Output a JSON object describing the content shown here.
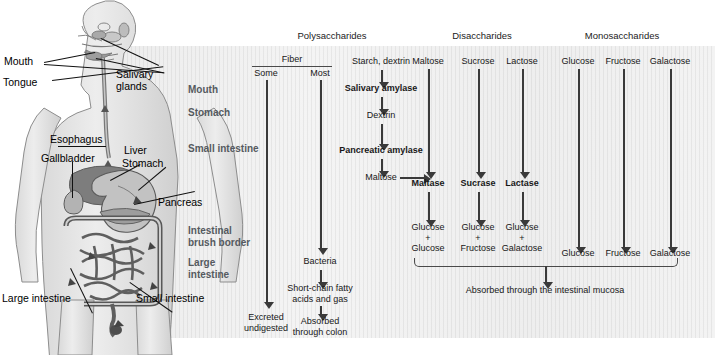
{
  "diagram": {
    "background_color": "#efefef",
    "line_color": "#3a3a3a",
    "row_label_color": "#555a5f"
  },
  "anatomy": {
    "name": "human-digestive-system",
    "labels": [
      {
        "id": "mouth",
        "text": "Mouth"
      },
      {
        "id": "tongue",
        "text": "Tongue"
      },
      {
        "id": "salivary-glands",
        "text": "Salivary\nglands"
      },
      {
        "id": "salivary-glands-l1",
        "text": "Salivary"
      },
      {
        "id": "salivary-glands-l2",
        "text": "glands"
      },
      {
        "id": "esophagus",
        "text": "Esophagus"
      },
      {
        "id": "gallbladder",
        "text": "Gallbladder"
      },
      {
        "id": "liver",
        "text": "Liver"
      },
      {
        "id": "stomach",
        "text": "Stomach"
      },
      {
        "id": "pancreas",
        "text": "Pancreas"
      },
      {
        "id": "large-intestine",
        "text": "Large intestine"
      },
      {
        "id": "small-intestine",
        "text": "Small intestine"
      }
    ]
  },
  "row_labels": [
    {
      "id": "mouth",
      "text": "Mouth"
    },
    {
      "id": "stomach",
      "text": "Stomach"
    },
    {
      "id": "small-intestine",
      "text": "Small intestine"
    },
    {
      "id": "intestinal-brush-border-l1",
      "text": "Intestinal"
    },
    {
      "id": "intestinal-brush-border-l2",
      "text": "brush border"
    },
    {
      "id": "large-intestine-l1",
      "text": "Large"
    },
    {
      "id": "large-intestine-l2",
      "text": "intestine"
    }
  ],
  "group_headers": [
    {
      "id": "polysaccharides",
      "text": "Polysaccharides"
    },
    {
      "id": "disaccharides",
      "text": "Disaccharides"
    },
    {
      "id": "monosaccharides",
      "text": "Monosaccharides"
    }
  ],
  "flow": {
    "fiber": {
      "header": "Fiber",
      "some": "Some",
      "most": "Most",
      "some_end": "Excreted\nundigested",
      "some_end_l1": "Excreted",
      "some_end_l2": "undigested",
      "bacteria": "Bacteria",
      "scfa_l1": "Short-chain fatty",
      "scfa_l2": "acids and gas",
      "most_end_l1": "Absorbed",
      "most_end_l2": "through colon"
    },
    "starch": {
      "source": "Starch, dextrin",
      "enzyme1": "Salivary amylase",
      "product1": "Dextrin",
      "enzyme2": "Pancreatic amylase",
      "product2": "Maltose"
    },
    "disaccharides": [
      {
        "substrate": "Maltose",
        "enzyme": "Maltase",
        "products": [
          "Glucose",
          "+",
          "Glucose"
        ]
      },
      {
        "substrate": "Sucrose",
        "enzyme": "Sucrase",
        "products": [
          "Glucose",
          "+",
          "Fructose"
        ]
      },
      {
        "substrate": "Lactose",
        "enzyme": "Lactase",
        "products": [
          "Glucose",
          "+",
          "Galactose"
        ]
      }
    ],
    "monosaccharides": [
      {
        "substrate": "Glucose",
        "product": "Glucose"
      },
      {
        "substrate": "Fructose",
        "product": "Fructose"
      },
      {
        "substrate": "Galactose",
        "product": "Galactose"
      }
    ],
    "absorption": "Absorbed through the intestinal mucosa"
  }
}
